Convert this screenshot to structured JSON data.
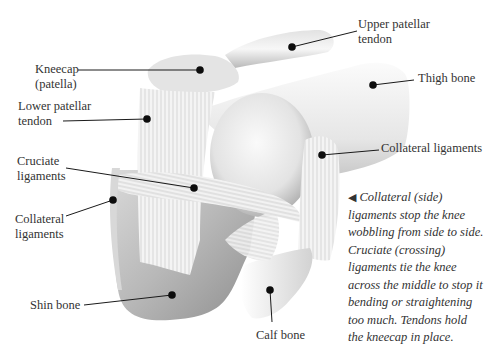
{
  "diagram": {
    "labels": [
      {
        "id": "upper-patellar-tendon",
        "lines": [
          "Upper patellar",
          "tendon"
        ],
        "dot": [
          292,
          47
        ]
      },
      {
        "id": "kneecap",
        "lines": [
          "Kneecap",
          "(patella)"
        ],
        "dot": [
          200,
          70
        ]
      },
      {
        "id": "thigh-bone",
        "lines": [
          "Thigh bone"
        ],
        "dot": [
          373,
          85
        ]
      },
      {
        "id": "lower-patellar-tendon",
        "lines": [
          "Lower patellar",
          "tendon"
        ],
        "dot": [
          147,
          119
        ]
      },
      {
        "id": "collateral-ligaments-right",
        "lines": [
          "Collateral ligaments"
        ],
        "dot": [
          322,
          155
        ]
      },
      {
        "id": "cruciate-ligaments",
        "lines": [
          "Cruciate",
          "ligaments"
        ],
        "dot": [
          194,
          188
        ]
      },
      {
        "id": "collateral-ligaments-left",
        "lines": [
          "Collateral",
          "ligaments"
        ],
        "dot": [
          113,
          200
        ]
      },
      {
        "id": "shin-bone",
        "lines": [
          "Shin bone"
        ],
        "dot": [
          172,
          295
        ]
      },
      {
        "id": "calf-bone",
        "lines": [
          "Calf bone"
        ],
        "dot": [
          270,
          290
        ]
      }
    ],
    "caption": {
      "arrow": "◀",
      "lines": [
        "Collateral (side)",
        "ligaments stop the knee",
        "wobbling from side to side.",
        "Cruciate (crossing)",
        "ligaments tie the knee",
        "across the middle to stop it",
        "bending or straightening",
        "too much. Tendons hold",
        "the kneecap in place."
      ]
    },
    "colors": {
      "background": "#ffffff",
      "leader_line": "#1a1a1a",
      "dot": "#0d0d0d",
      "bone_light": "#f2f2f2",
      "bone_shadow": "#a9a9a9",
      "text": "#333333"
    }
  }
}
